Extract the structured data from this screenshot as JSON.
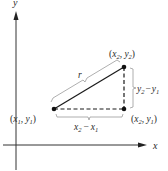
{
  "diagram": {
    "type": "distance-formula-right-triangle",
    "axes": {
      "x_label": "x",
      "y_label": "y"
    },
    "points": [
      {
        "id": "p1",
        "label": "(x1, y1)",
        "name": "x",
        "sub": "1",
        "name2": "y",
        "sub2": "1"
      },
      {
        "id": "p2",
        "label": "(x2, y2)",
        "name": "x",
        "sub": "2",
        "name2": "y",
        "sub2": "2"
      },
      {
        "id": "p3",
        "label": "(x2, y1)",
        "name": "x",
        "sub": "2",
        "name2": "y",
        "sub2": "1"
      }
    ],
    "segments": {
      "hypotenuse": {
        "label": "r",
        "style": "solid"
      },
      "horizontal": {
        "label": "x2 − x1",
        "a": "x",
        "a_sub": "2",
        "b": "x",
        "b_sub": "1",
        "op": "−",
        "style": "dashed"
      },
      "vertical": {
        "label": "y2 − y1",
        "a": "y",
        "a_sub": "2",
        "b": "y",
        "b_sub": "1",
        "op": "−",
        "style": "dashed"
      }
    },
    "colors": {
      "line": "#1a1a1a",
      "brace": "#8a8a8a",
      "text": "#2a2a2a",
      "background": "#ffffff"
    }
  }
}
